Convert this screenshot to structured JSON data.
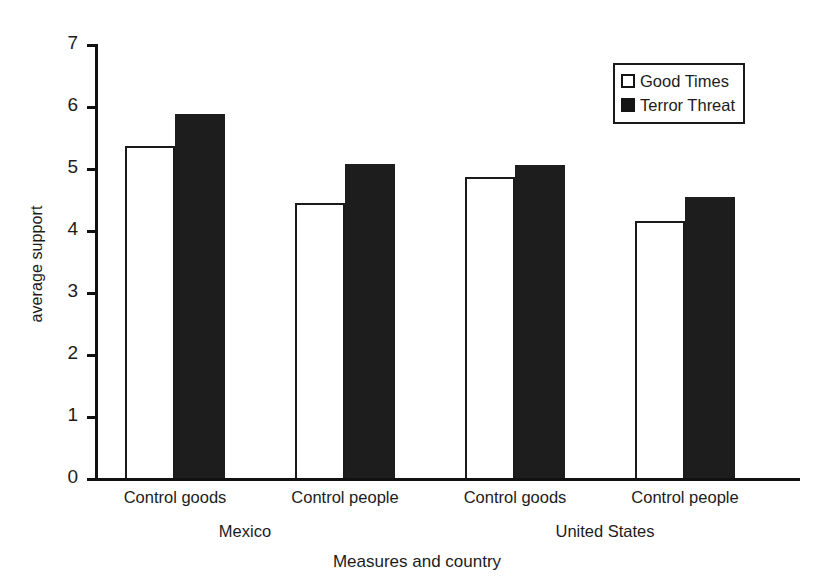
{
  "chart_data": {
    "type": "bar",
    "title": "",
    "xlabel": "Measures and country",
    "ylabel": "average support",
    "ylim": [
      0,
      7
    ],
    "ytick_labels": [
      "7",
      "6",
      "5",
      "4",
      "3",
      "2",
      "1",
      "0"
    ],
    "ytick_values": [
      7,
      6,
      5,
      4,
      3,
      2,
      1,
      0
    ],
    "grid": false,
    "legend_position": "top-right",
    "categories": [
      "Control goods",
      "Control people",
      "Control goods",
      "Control people"
    ],
    "groups": [
      {
        "name": "Mexico",
        "categories": [
          "Control goods",
          "Control people"
        ]
      },
      {
        "name": "United States",
        "categories": [
          "Control goods",
          "Control people"
        ]
      }
    ],
    "series": [
      {
        "name": "Good Times",
        "style": "open",
        "values": [
          5.35,
          4.43,
          4.85,
          4.15
        ]
      },
      {
        "name": "Terror Threat",
        "style": "filled",
        "values": [
          5.87,
          5.07,
          5.05,
          4.53
        ]
      }
    ]
  },
  "legend": {
    "items": [
      {
        "label": "Good Times",
        "swatch": "open-square"
      },
      {
        "label": "Terror Threat",
        "swatch": "filled-square"
      }
    ]
  },
  "colors": {
    "open_fill": "#ffffff",
    "filled_fill": "#1d1d1d",
    "axis": "#111111",
    "text": "#1c1c1c",
    "background": "#ffffff"
  }
}
